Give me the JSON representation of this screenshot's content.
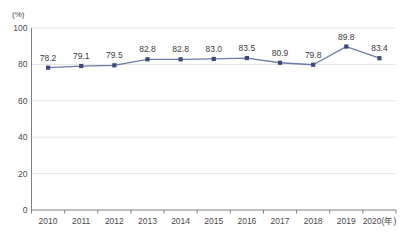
{
  "chart_data": {
    "type": "line",
    "title": "",
    "subtitle": "",
    "xlabel": "",
    "ylabel": "(%)",
    "unit_label": "(%)",
    "categories": [
      "2010",
      "2011",
      "2012",
      "2013",
      "2014",
      "2015",
      "2016",
      "2017",
      "2018",
      "2019",
      "2020(年)"
    ],
    "x_tick_labels": [
      "2010",
      "2011",
      "2012",
      "2013",
      "2014",
      "2015",
      "2016",
      "2017",
      "2018",
      "2019",
      "2020(年)"
    ],
    "values": [
      78.2,
      79.1,
      79.5,
      82.8,
      82.8,
      83.0,
      83.5,
      80.9,
      79.8,
      89.8,
      83.4
    ],
    "data_labels": [
      "78.2",
      "79.1",
      "79.5",
      "82.8",
      "82.8",
      "83.0",
      "83.5",
      "80.9",
      "79.8",
      "89.8",
      "83.4"
    ],
    "series": [
      {
        "name": "",
        "values": [
          78.2,
          79.1,
          79.5,
          82.8,
          82.8,
          83.0,
          83.5,
          80.9,
          79.8,
          89.8,
          83.4
        ],
        "color": "#6b7cab",
        "marker": "square",
        "marker_color": "#3d4a78"
      }
    ],
    "ylim": [
      0,
      100
    ],
    "y_ticks": [
      0,
      20,
      40,
      60,
      80,
      100
    ],
    "y_tick_labels": [
      "0",
      "20",
      "40",
      "60",
      "80",
      "100"
    ],
    "grid": true,
    "grid_axis": "y",
    "grid_color": "#e3e3e3",
    "axis_color": "#808080",
    "legend": false,
    "legend_position": "none",
    "background": "#ffffff"
  }
}
